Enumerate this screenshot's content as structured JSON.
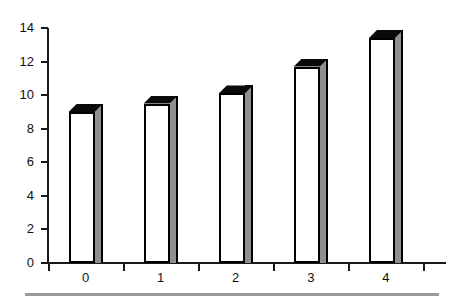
{
  "chart_data": {
    "type": "bar",
    "title": "",
    "subtitle": "",
    "xlabel": "",
    "ylabel": "",
    "categories": [
      "0",
      "1",
      "2",
      "3",
      "4"
    ],
    "values": [
      9.0,
      9.5,
      10.1,
      11.7,
      13.4
    ],
    "series": [
      {
        "name": "",
        "values": [
          9.0,
          9.5,
          10.1,
          11.7,
          13.4
        ]
      }
    ],
    "ylim": [
      0,
      14
    ],
    "xlim": [
      -0.5,
      4.75
    ],
    "y_ticks": [
      0,
      2,
      4,
      6,
      8,
      10,
      12,
      14
    ],
    "y_tick_labels": [
      "0",
      "2",
      "4",
      "6",
      "8",
      "10",
      "12",
      "14"
    ],
    "x_tick_labels": [
      "0",
      "1",
      "2",
      "3",
      "4"
    ],
    "grid": false,
    "legend": false,
    "legend_position": "none",
    "bar_style": "3d-extruded",
    "annotations": []
  },
  "style": {
    "background_color": "#ffffff",
    "axis_color": "#1a1a1a",
    "bar_face_color": "#ffffff",
    "bar_edge_color": "#000000",
    "bar_top_color": "#0a0a0a",
    "bar_side_color": "#8f8f8f",
    "tick_label_color": "#111111",
    "footer_rule_color": "#9a9a9a"
  },
  "icons": {
    "footer_rule": "horizontal-rule"
  }
}
